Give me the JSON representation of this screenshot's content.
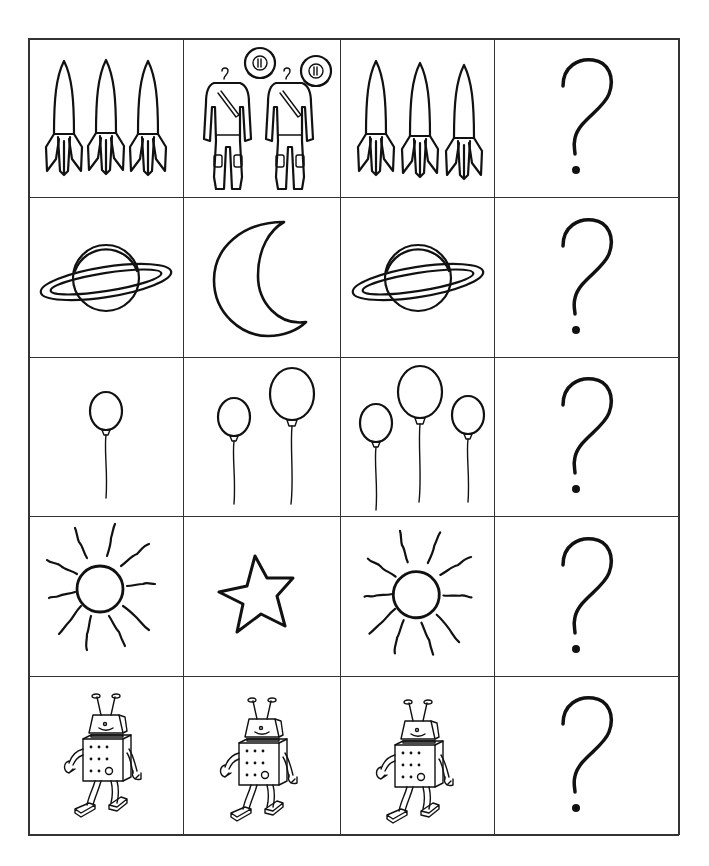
{
  "worksheet": {
    "title": "",
    "grid": {
      "columns": 4,
      "rows": 5,
      "line_color": "#333333"
    },
    "rows": [
      {
        "cells": [
          {
            "icon": "rocket-icon",
            "count": 3,
            "label": "3 rockets"
          },
          {
            "icon": "spacesuit-icon",
            "count": 2,
            "label": "2 spacesuits with helmets"
          },
          {
            "icon": "rocket-icon",
            "count": 3,
            "label": "3 rockets"
          },
          {
            "icon": "question-mark-icon",
            "text": "?"
          }
        ]
      },
      {
        "cells": [
          {
            "icon": "saturn-planet-icon",
            "count": 1,
            "label": "planet with ring"
          },
          {
            "icon": "crescent-moon-icon",
            "count": 1,
            "label": "crescent moon"
          },
          {
            "icon": "saturn-planet-icon",
            "count": 1,
            "label": "planet with ring"
          },
          {
            "icon": "question-mark-icon",
            "text": "?"
          }
        ]
      },
      {
        "cells": [
          {
            "icon": "balloon-icon",
            "count": 1,
            "label": "1 balloon"
          },
          {
            "icon": "balloon-icon",
            "count": 2,
            "label": "2 balloons"
          },
          {
            "icon": "balloon-icon",
            "count": 3,
            "label": "3 balloons"
          },
          {
            "icon": "question-mark-icon",
            "text": "?"
          }
        ]
      },
      {
        "cells": [
          {
            "icon": "sun-icon",
            "count": 1,
            "label": "sun"
          },
          {
            "icon": "star-icon",
            "count": 1,
            "label": "star"
          },
          {
            "icon": "sun-icon",
            "count": 1,
            "label": "sun"
          },
          {
            "icon": "question-mark-icon",
            "text": "?"
          }
        ]
      },
      {
        "cells": [
          {
            "icon": "robot-icon",
            "count": 1,
            "label": "robot"
          },
          {
            "icon": "robot-icon",
            "count": 1,
            "label": "robot"
          },
          {
            "icon": "robot-icon",
            "count": 1,
            "label": "robot"
          },
          {
            "icon": "question-mark-icon",
            "text": "?"
          }
        ]
      }
    ]
  }
}
